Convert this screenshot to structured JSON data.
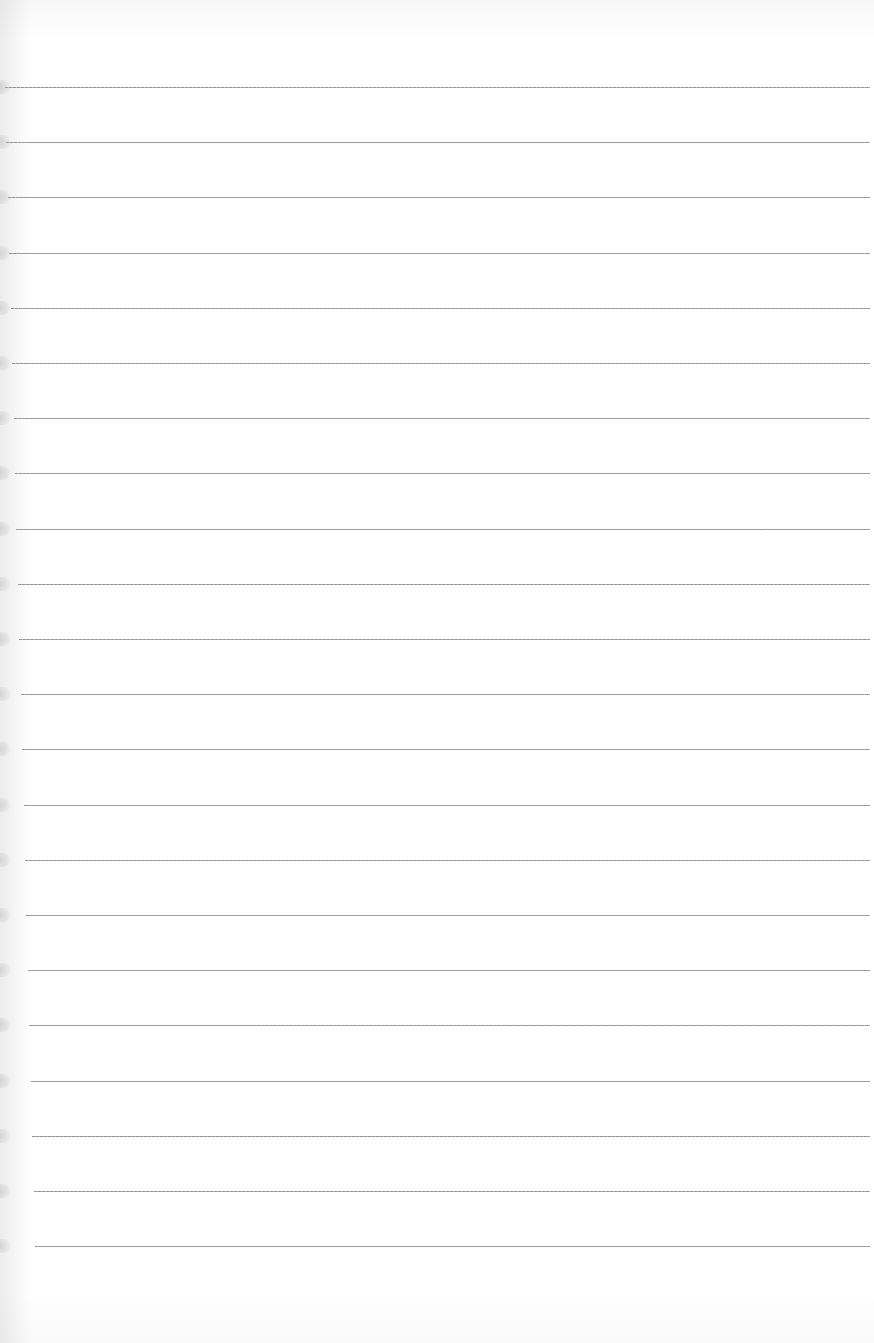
{
  "sheet": {
    "type": "ruled-paper",
    "line_count": 22,
    "line_color": "#8a8a8a",
    "paper_color": "#ffffff",
    "first_line_y": 87,
    "line_spacing": 55.2,
    "line_start_x_top": 5,
    "line_start_x_bottom": 35,
    "line_end_x": 870
  }
}
